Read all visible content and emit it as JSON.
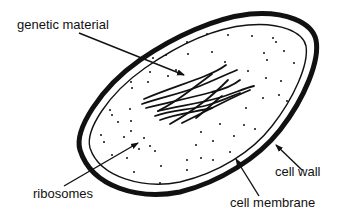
{
  "colors": {
    "ink": "#111111",
    "background": "#ffffff"
  },
  "labels": {
    "genetic_material": "genetic material",
    "ribosomes": "ribosomes",
    "cell_wall": "cell wall",
    "cell_membrane": "cell membrane"
  }
}
